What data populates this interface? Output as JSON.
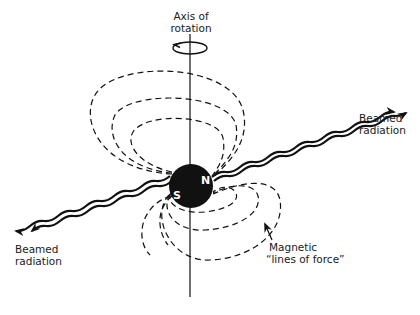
{
  "labels": {
    "axis_line1": "Axis of",
    "axis_line2": "rotation",
    "beam_right_line1": "Beamed",
    "beam_right_line2": "radiation",
    "beam_left_line1": "Beamed",
    "beam_left_line2": "radiation",
    "field_line1": "Magnetic",
    "field_line2": "“lines of force”",
    "pole_north": "N",
    "pole_south": "S"
  },
  "colors": {
    "ink": "#111111",
    "background": "#ffffff"
  }
}
